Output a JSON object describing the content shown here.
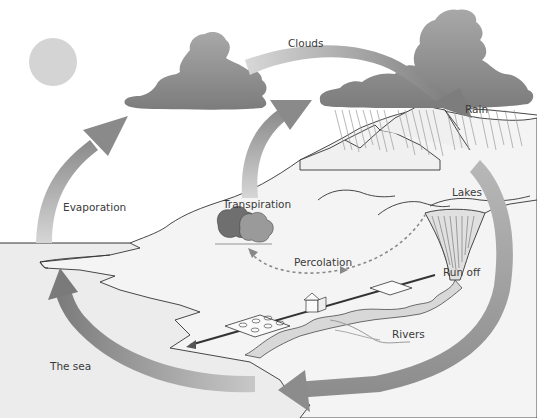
{
  "diagram": {
    "labels": {
      "clouds": "Clouds",
      "rain": "Rain",
      "evaporation": "Evaporation",
      "transpiration": "Transpiration",
      "lakes": "Lakes",
      "percolation": "Percolation",
      "run_off": "Run off",
      "rivers": "Rivers",
      "the_sea": "The sea"
    },
    "colors": {
      "sun": "#d4d4d4",
      "cloud": "#8e8e8e",
      "arrow": "#a6a6a6",
      "sea": "#ececec",
      "land": "#f2f2f2",
      "tree_dark": "#6f6f6f",
      "tree_light": "#9a9a9a",
      "outline": "#333333"
    }
  }
}
